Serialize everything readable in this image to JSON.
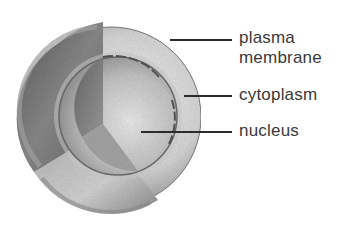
{
  "diagram": {
    "labels": [
      {
        "id": "plasma-membrane",
        "line1": "plasma",
        "line2": "membrane"
      },
      {
        "id": "cytoplasm",
        "text": "cytoplasm"
      },
      {
        "id": "nucleus",
        "text": "nucleus"
      }
    ],
    "colors": {
      "background": "#ffffff",
      "text": "#3a3a3a",
      "leader_line": "#2b2b2b"
    }
  }
}
